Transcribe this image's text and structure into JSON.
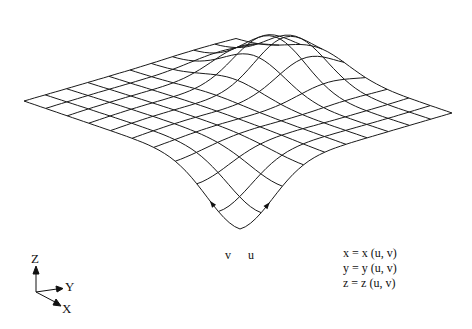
{
  "diagram": {
    "surface": {
      "grid_u": 10,
      "grid_v": 10,
      "stroke_color": "#1a1a1a",
      "origin_px": [
        240,
        175
      ],
      "u_edge_px": [
        212,
        -62
      ],
      "v_edge_px": [
        -216,
        -74
      ],
      "features": [
        {
          "name": "front-dip",
          "u": 0.0,
          "v": 0.0,
          "height_px": -54,
          "width": 0.22
        },
        {
          "name": "back-bump",
          "u": 0.82,
          "v": 0.62,
          "height_px": 44,
          "width": 0.2
        }
      ],
      "param_labels": {
        "u": "u",
        "v": "v"
      }
    },
    "axes_triad": {
      "labels": {
        "z": "Z",
        "y": "Y",
        "x": "X"
      }
    },
    "equations": [
      "x = x (u, v)",
      "y = y (u, v)",
      "z = z (u, v)"
    ]
  }
}
